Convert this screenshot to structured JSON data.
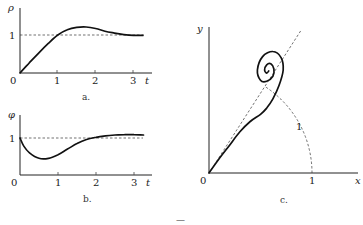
{
  "figure": {
    "panels": [
      {
        "id": "a",
        "caption": "a.",
        "y_label": "ρ",
        "x_label": "t",
        "origin_label": "0",
        "x_ticks": [
          "1",
          "2",
          "3"
        ],
        "y_ticks": [
          "1"
        ]
      },
      {
        "id": "b",
        "caption": "b.",
        "y_label": "φ",
        "x_label": "t",
        "origin_label": "0",
        "x_ticks": [
          "1",
          "2",
          "3"
        ],
        "y_ticks": [
          "1"
        ]
      },
      {
        "id": "c",
        "caption": "c.",
        "y_label": "y",
        "x_label": "x",
        "origin_label": "0",
        "x_ticks": [
          "1"
        ],
        "arc_label": "1"
      }
    ],
    "footer_mark": "—"
  },
  "chart_data": [
    {
      "type": "line",
      "title": "a.",
      "xlabel": "t",
      "ylabel": "ρ",
      "xlim": [
        0,
        3.4
      ],
      "ylim": [
        0,
        1.45
      ],
      "reference_line": {
        "y": 1,
        "style": "dashed"
      },
      "x": [
        0,
        0.25,
        0.5,
        0.75,
        1.0,
        1.25,
        1.5,
        1.75,
        2.0,
        2.25,
        2.5,
        2.75,
        3.0,
        3.25
      ],
      "y": [
        0,
        0.27,
        0.53,
        0.78,
        1.0,
        1.14,
        1.2,
        1.21,
        1.17,
        1.1,
        1.05,
        1.01,
        0.99,
        0.99
      ]
    },
    {
      "type": "line",
      "title": "b.",
      "xlabel": "t",
      "ylabel": "φ",
      "xlim": [
        0,
        3.4
      ],
      "ylim": [
        0,
        1.45
      ],
      "reference_line": {
        "y": 1,
        "style": "dashed"
      },
      "x": [
        0,
        0.1,
        0.25,
        0.5,
        0.75,
        1.0,
        1.25,
        1.5,
        1.75,
        2.0,
        2.25,
        2.5,
        2.75,
        3.0,
        3.25
      ],
      "y": [
        1.0,
        0.78,
        0.6,
        0.45,
        0.45,
        0.55,
        0.7,
        0.85,
        0.96,
        1.02,
        1.06,
        1.08,
        1.09,
        1.09,
        1.08
      ]
    },
    {
      "type": "line",
      "title": "c.",
      "xlabel": "x",
      "ylabel": "y",
      "xlim": [
        0,
        1.25
      ],
      "ylim": [
        0,
        1.45
      ],
      "reference_line": {
        "type": "ray",
        "slope": 1.55,
        "style": "dashed"
      },
      "reference_arc": {
        "radius": 1,
        "from_deg": 0,
        "to_deg": 57,
        "style": "dashed",
        "label": "1"
      },
      "x": [
        0,
        0.1,
        0.2,
        0.3,
        0.4,
        0.5,
        0.56,
        0.62,
        0.68,
        0.72,
        0.7,
        0.62,
        0.52,
        0.47,
        0.5,
        0.56,
        0.62,
        0.63,
        0.6,
        0.56,
        0.54,
        0.56,
        0.58
      ],
      "y": [
        0,
        0.14,
        0.27,
        0.4,
        0.5,
        0.57,
        0.63,
        0.72,
        0.85,
        1.0,
        1.12,
        1.18,
        1.13,
        1.0,
        0.9,
        0.89,
        0.94,
        1.01,
        1.06,
        1.05,
        1.0,
        0.97,
        0.99
      ]
    }
  ]
}
